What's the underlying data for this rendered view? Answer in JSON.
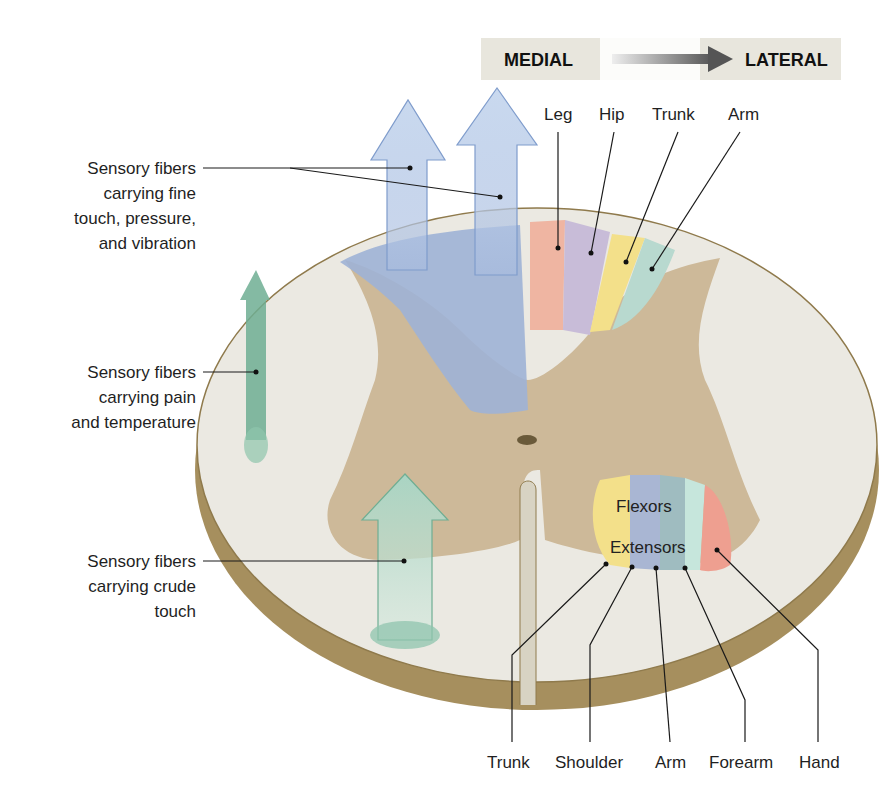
{
  "header": {
    "medial": "MEDIAL",
    "lateral": "LATERAL",
    "arrow_icon": "right-arrow-icon"
  },
  "dorsal_column_labels": [
    "Leg",
    "Hip",
    "Trunk",
    "Arm"
  ],
  "left_labels": {
    "fine_touch": [
      "Sensory fibers",
      "carrying fine",
      "touch, pressure,",
      "and vibration"
    ],
    "pain_temp": [
      "Sensory fibers",
      "carrying pain",
      "and temperature"
    ],
    "crude_touch": [
      "Sensory fibers",
      "carrying crude",
      "touch"
    ]
  },
  "motor_region": {
    "flexors": "Flexors",
    "extensors": "Extensors"
  },
  "ventral_labels": [
    "Trunk",
    "Shoulder",
    "Arm",
    "Forearm",
    "Hand"
  ],
  "colors": {
    "white_matter": "#ebe9e2",
    "gray_matter": "#cdb999",
    "edge": "#a08a5c",
    "dorsal_blue": "#9fb3d6",
    "leg": "#efb5a2",
    "hip": "#c8bcd8",
    "trunk": "#f3e08a",
    "arm": "#b8d9cf",
    "hand": "#ee9f90",
    "shoulder": "#a9b6d3",
    "forearm": "#c6e6dc",
    "pain_arrow": "#6fae93",
    "crude_arrow": "#8fc4ad"
  }
}
